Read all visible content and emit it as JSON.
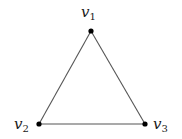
{
  "diagram": {
    "type": "graph",
    "colors": {
      "edge": "#555555",
      "vertex": "#000000",
      "label": "#1a1a1a",
      "background": "#ffffff"
    },
    "vertices": [
      {
        "id": "v1",
        "label_base": "v",
        "label_sub": "1",
        "label_side": "above"
      },
      {
        "id": "v2",
        "label_base": "v",
        "label_sub": "2",
        "label_side": "left"
      },
      {
        "id": "v3",
        "label_base": "v",
        "label_sub": "3",
        "label_side": "right"
      }
    ],
    "edges": [
      {
        "from": "v1",
        "to": "v2"
      },
      {
        "from": "v1",
        "to": "v3"
      },
      {
        "from": "v2",
        "to": "v3"
      }
    ]
  }
}
